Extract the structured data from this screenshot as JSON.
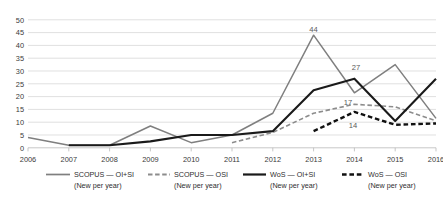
{
  "chart_data": {
    "type": "line",
    "title": "",
    "xlabel": "",
    "ylabel": "",
    "x": [
      2006,
      2007,
      2008,
      2009,
      2010,
      2011,
      2012,
      2013,
      2014,
      2015,
      2016
    ],
    "categories": [
      "2006",
      "2007",
      "2008",
      "2009",
      "2010",
      "2011",
      "2012",
      "2013",
      "2014",
      "2015",
      "2016"
    ],
    "ylim": [
      0,
      50
    ],
    "yticks": [
      0,
      5,
      10,
      15,
      20,
      25,
      30,
      35,
      40,
      45,
      50
    ],
    "ytick_labels": [
      "0",
      "5",
      "10",
      "15",
      "20",
      "25",
      "30",
      "35",
      "40",
      "45",
      "50"
    ],
    "grid": true,
    "legend_position": "bottom",
    "series": [
      {
        "name": "SCOPUS — OI+SI",
        "sublabel": "(New per year)",
        "style": "solid",
        "color": "#7f7f7f",
        "x": [
          2006,
          2007,
          2008,
          2009,
          2010,
          2011,
          2012,
          2013,
          2014,
          2015,
          2016
        ],
        "values": [
          4,
          1,
          1,
          8.5,
          2,
          5,
          13.5,
          44,
          21.5,
          32.5,
          11.5
        ]
      },
      {
        "name": "SCOPUS — OSI",
        "sublabel": "(New per year)",
        "style": "dashed",
        "color": "#8c8c8c",
        "x": [
          2011,
          2012,
          2013,
          2014,
          2015,
          2016
        ],
        "values": [
          2,
          6,
          13.5,
          17,
          16,
          10.5
        ]
      },
      {
        "name": "WoS — OI+SI",
        "sublabel": "(New per year)",
        "style": "solid",
        "color": "#1a1a1a",
        "x": [
          2007,
          2008,
          2009,
          2010,
          2011,
          2012,
          2013,
          2014,
          2015,
          2016
        ],
        "values": [
          1,
          1,
          2.5,
          5,
          5,
          6.5,
          22.5,
          27,
          10.5,
          27
        ]
      },
      {
        "name": "WoS — OSI",
        "sublabel": "(New per year)",
        "style": "dashed",
        "color": "#111111",
        "x": [
          2013,
          2014,
          2015,
          2016
        ],
        "values": [
          6.5,
          14,
          9,
          9.5
        ]
      }
    ],
    "annotations": [
      {
        "text": "44",
        "x": 2013,
        "y": 44,
        "series": "SCOPUS — OI+SI"
      },
      {
        "text": "27",
        "x": 2014,
        "y": 27,
        "series": "WoS — OI+SI"
      },
      {
        "text": "17",
        "x": 2014,
        "y": 17,
        "series": "SCOPUS — OSI"
      },
      {
        "text": "14",
        "x": 2014,
        "y": 14,
        "series": "WoS — OSI"
      }
    ]
  },
  "legend": {
    "items": [
      {
        "label": "SCOPUS — OI+SI",
        "sublabel": "(New per year)"
      },
      {
        "label": "SCOPUS — OSI",
        "sublabel": "(New per year)"
      },
      {
        "label": "WoS — OI+SI",
        "sublabel": "(New per year)"
      },
      {
        "label": "WoS — OSI",
        "sublabel": "(New per year)"
      }
    ]
  }
}
